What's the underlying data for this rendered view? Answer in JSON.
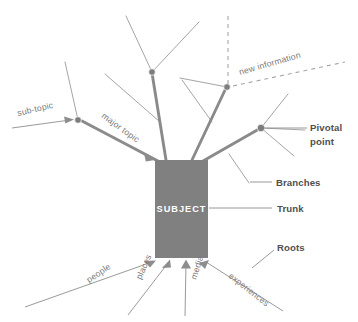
{
  "diagram": {
    "type": "tree-metaphor-diagram",
    "background_color": "#ffffff",
    "trunk_color": "#808080",
    "branch_color": "#8a8a8a",
    "twig_color": "#9a9a9a",
    "label_color": "#7a7a7a",
    "callout_color": "#4f4f4f",
    "center": {
      "label": "SUBJECT",
      "shape": "rectangle",
      "fill": "#808080",
      "text_color": "#ffffff"
    },
    "inline_labels": [
      {
        "id": "sub-topic",
        "text": "sub-topic",
        "rotation": -13,
        "x": 18,
        "y": 116
      },
      {
        "id": "major-topic",
        "text": "major topic",
        "rotation": 36,
        "x": 101,
        "y": 117
      },
      {
        "id": "new-information",
        "text": "new information",
        "rotation": -16,
        "x": 240,
        "y": 75
      }
    ],
    "root_labels": [
      {
        "id": "people",
        "text": "people",
        "rotation": -34,
        "x": 89,
        "y": 283
      },
      {
        "id": "places",
        "text": "places",
        "rotation": -66,
        "x": 141,
        "y": 280
      },
      {
        "id": "media",
        "text": "media",
        "rotation": -72,
        "x": 196,
        "y": 280
      },
      {
        "id": "experiences",
        "text": "experiences",
        "rotation": 38,
        "x": 228,
        "y": 277
      }
    ],
    "callouts": [
      {
        "id": "pivotal-point",
        "line1": "Pivotal",
        "line2": "point",
        "x": 310,
        "y": 131
      },
      {
        "id": "branches",
        "line1": "Branches",
        "line2": "",
        "x": 276,
        "y": 184
      },
      {
        "id": "trunk",
        "line1": "Trunk",
        "line2": "",
        "x": 277,
        "y": 209
      },
      {
        "id": "roots",
        "line1": "Roots",
        "line2": "",
        "x": 277,
        "y": 248
      }
    ]
  }
}
